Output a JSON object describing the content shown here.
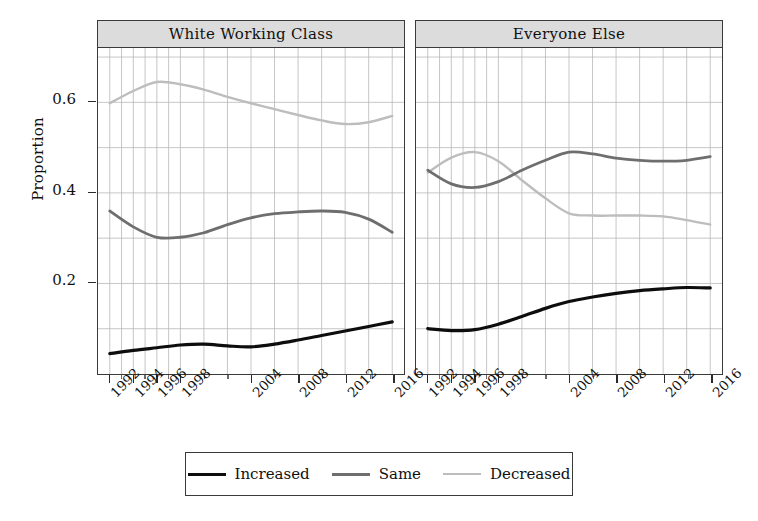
{
  "axis": {
    "y_title": "Proportion",
    "y_ticks": [
      "0.2",
      "0.4",
      "0.6"
    ],
    "x_ticks": [
      "1992",
      "1994",
      "1996",
      "1998",
      "2004",
      "2008",
      "2012",
      "2016"
    ]
  },
  "panels": [
    {
      "title": "White Working Class"
    },
    {
      "title": "Everyone Else"
    }
  ],
  "legend": {
    "items": [
      {
        "label": "Increased",
        "color": "#0d0d0d",
        "width": 3.6
      },
      {
        "label": "Same",
        "color": "#6e6e6e",
        "width": 3.0
      },
      {
        "label": "Decreased",
        "color": "#bdbdbd",
        "width": 2.6
      }
    ]
  },
  "chart_data": {
    "type": "line",
    "title": "",
    "xlabel": "",
    "ylabel": "Proportion",
    "xlim": [
      1991,
      2017
    ],
    "ylim": [
      0.0,
      0.72
    ],
    "grid": true,
    "legend_position": "bottom",
    "facets": [
      {
        "name": "White Working Class",
        "x": [
          1992,
          1994,
          1996,
          1998,
          2000,
          2002,
          2004,
          2006,
          2008,
          2010,
          2012,
          2014,
          2016
        ],
        "series": [
          {
            "name": "Increased",
            "color": "#0d0d0d",
            "values": [
              0.045,
              0.052,
              0.058,
              0.064,
              0.066,
              0.062,
              0.06,
              0.066,
              0.075,
              0.085,
              0.095,
              0.105,
              0.115
            ]
          },
          {
            "name": "Same",
            "color": "#6e6e6e",
            "values": [
              0.36,
              0.325,
              0.302,
              0.302,
              0.312,
              0.33,
              0.345,
              0.354,
              0.358,
              0.36,
              0.357,
              0.342,
              0.313
            ]
          },
          {
            "name": "Decreased",
            "color": "#bdbdbd",
            "values": [
              0.598,
              0.625,
              0.645,
              0.64,
              0.628,
              0.612,
              0.598,
              0.585,
              0.572,
              0.56,
              0.552,
              0.556,
              0.57
            ]
          }
        ]
      },
      {
        "name": "Everyone Else",
        "x": [
          1992,
          1994,
          1996,
          1998,
          2000,
          2002,
          2004,
          2006,
          2008,
          2010,
          2012,
          2014,
          2016
        ],
        "series": [
          {
            "name": "Increased",
            "color": "#0d0d0d",
            "values": [
              0.1,
              0.096,
              0.098,
              0.11,
              0.127,
              0.145,
              0.16,
              0.17,
              0.178,
              0.184,
              0.188,
              0.191,
              0.19
            ]
          },
          {
            "name": "Same",
            "color": "#6e6e6e",
            "values": [
              0.45,
              0.42,
              0.412,
              0.425,
              0.45,
              0.472,
              0.49,
              0.486,
              0.477,
              0.472,
              0.47,
              0.472,
              0.48
            ]
          },
          {
            "name": "Decreased",
            "color": "#bdbdbd",
            "values": [
              0.445,
              0.478,
              0.49,
              0.47,
              0.428,
              0.388,
              0.355,
              0.35,
              0.35,
              0.35,
              0.348,
              0.34,
              0.33
            ]
          }
        ]
      }
    ]
  }
}
